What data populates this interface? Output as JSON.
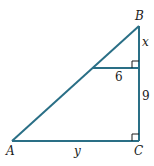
{
  "diagram": {
    "type": "right-triangle-similar",
    "stroke_color": "#2a6f86",
    "vertices": {
      "A": {
        "label": "A"
      },
      "B": {
        "label": "B"
      },
      "C": {
        "label": "C"
      }
    },
    "segment_labels": {
      "upper_right_side": "x",
      "inner_segment": "6",
      "lower_right_side": "9",
      "base": "y"
    }
  }
}
